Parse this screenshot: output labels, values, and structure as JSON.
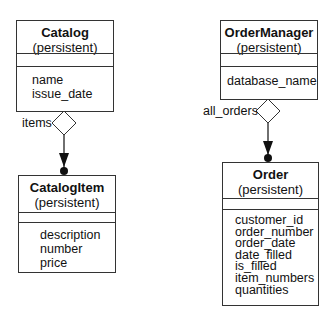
{
  "classes": {
    "catalog": {
      "name": "Catalog",
      "stereotype": "(persistent)",
      "attributes": [
        "name",
        "issue_date"
      ]
    },
    "catalog_item": {
      "name": "CatalogItem",
      "stereotype": "(persistent)",
      "attributes": [
        "description",
        "number",
        "price"
      ]
    },
    "order_manager": {
      "name": "OrderManager",
      "stereotype": "(persistent)",
      "attributes": [
        "database_name"
      ]
    },
    "order": {
      "name": "Order",
      "stereotype": "(persistent)",
      "attributes": [
        "customer_id",
        "order_number",
        "order_date",
        "date_filled",
        "is_filled",
        "item_numbers",
        "quantities"
      ]
    }
  },
  "associations": {
    "catalog_items": {
      "role": "items",
      "type": "aggregation",
      "from": "Catalog",
      "to": "CatalogItem"
    },
    "manager_orders": {
      "role": "all_orders",
      "type": "aggregation",
      "from": "OrderManager",
      "to": "Order"
    }
  }
}
